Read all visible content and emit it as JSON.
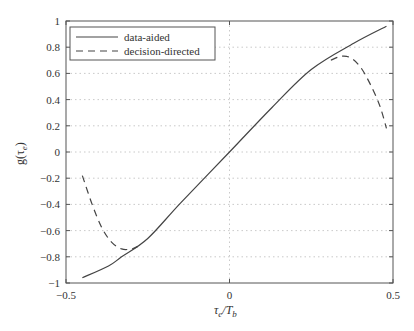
{
  "chart_data": {
    "type": "line",
    "title": "",
    "xlabel": "τe/Tb",
    "ylabel": "g(τe)",
    "xlim": [
      -0.5,
      0.5
    ],
    "ylim": [
      -1,
      1
    ],
    "xticks": [
      -0.5,
      0,
      0.5
    ],
    "xtick_labels": [
      "−0.5",
      "0",
      "0.5"
    ],
    "yticks": [
      -1,
      -0.8,
      -0.6,
      -0.4,
      -0.2,
      0,
      0.2,
      0.4,
      0.6,
      0.8,
      1
    ],
    "ytick_labels": [
      "−1",
      "−0.8",
      "−0.6",
      "−0.4",
      "−0.2",
      "0",
      "0.2",
      "0.4",
      "0.6",
      "0.8",
      "1"
    ],
    "grid": true,
    "legend_position": "upper left",
    "series": [
      {
        "name": "data-aided",
        "style": "solid",
        "color": "#444444",
        "x": [
          -0.45,
          -0.37,
          -0.33,
          -0.25,
          -0.15,
          0,
          0.13,
          0.25,
          0.38,
          0.48
        ],
        "y": [
          -0.96,
          -0.87,
          -0.8,
          -0.66,
          -0.39,
          0,
          0.34,
          0.63,
          0.83,
          0.96
        ]
      },
      {
        "name": "decision-directed",
        "style": "dashed",
        "color": "#444444",
        "segments": [
          {
            "x": [
              -0.45,
              -0.42,
              -0.39,
              -0.36,
              -0.33,
              -0.3,
              -0.28
            ],
            "y": [
              -0.18,
              -0.4,
              -0.58,
              -0.69,
              -0.74,
              -0.74,
              -0.72
            ]
          },
          {
            "x": [
              0.31,
              0.34,
              0.37,
              0.4,
              0.43,
              0.46,
              0.48
            ],
            "y": [
              0.7,
              0.73,
              0.72,
              0.65,
              0.52,
              0.35,
              0.18
            ]
          }
        ]
      }
    ]
  },
  "legend": {
    "items": [
      {
        "label": "data-aided",
        "style": "solid"
      },
      {
        "label": "decision-directed",
        "style": "dashed"
      }
    ]
  },
  "axes": {
    "xlabel_main": "τ",
    "xlabel_sub1": "e",
    "xlabel_mid": "/T",
    "xlabel_sub2": "b",
    "ylabel_main": "g(τ",
    "ylabel_sub": "e",
    "ylabel_end": ")"
  }
}
